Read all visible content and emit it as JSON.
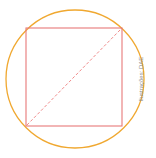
{
  "diagram": {
    "circle": {
      "cx": 75,
      "cy": 79,
      "r": 69,
      "color": "#f0a830"
    },
    "square": {
      "x": 26,
      "y": 28,
      "size": 96,
      "color": "#e87878"
    },
    "diagonal": {
      "x1": 26,
      "y1": 126,
      "x2": 122,
      "y2": 28,
      "color": "#f08a8a",
      "style": "dashed"
    }
  },
  "credit": "Ilustrações: DAE"
}
